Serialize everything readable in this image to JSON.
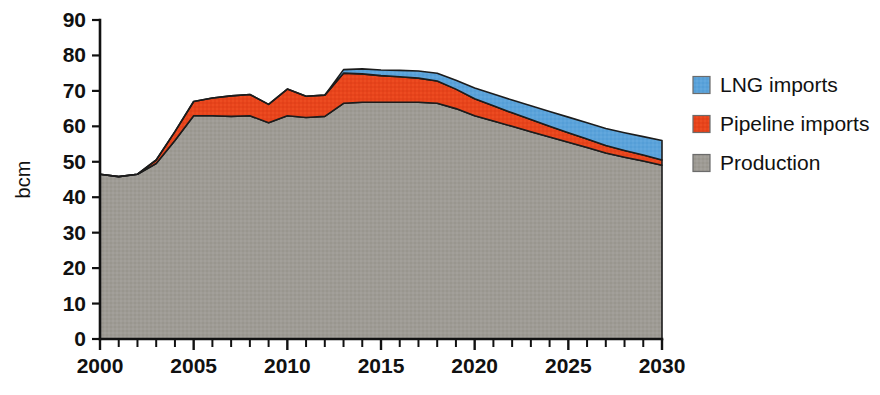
{
  "chart_data": {
    "type": "area",
    "title": "",
    "xlabel": "",
    "ylabel": "bcm",
    "stacked": true,
    "grid": false,
    "legend_position": "right",
    "xlim": [
      2000,
      2030
    ],
    "ylim": [
      0,
      90
    ],
    "y_ticks": [
      0,
      10,
      20,
      30,
      40,
      50,
      60,
      70,
      80,
      90
    ],
    "x_ticks": [
      2000,
      2005,
      2010,
      2015,
      2020,
      2025,
      2030
    ],
    "x_tick_labels": [
      "2000",
      "2005",
      "2010",
      "2015",
      "2020",
      "2025",
      "2030"
    ],
    "y_tick_labels": [
      "0",
      "10",
      "20",
      "30",
      "40",
      "50",
      "60",
      "70",
      "80",
      "90"
    ],
    "x_minor_tick_interval": 1,
    "x": [
      2000,
      2001,
      2002,
      2003,
      2004,
      2005,
      2006,
      2007,
      2008,
      2009,
      2010,
      2011,
      2012,
      2013,
      2014,
      2015,
      2016,
      2017,
      2018,
      2019,
      2020,
      2021,
      2022,
      2023,
      2024,
      2025,
      2026,
      2027,
      2028,
      2029,
      2030
    ],
    "series": [
      {
        "name": "Production",
        "color": "#9e9b95",
        "values": [
          46.5,
          45.8,
          46.5,
          49.5,
          56.0,
          63.0,
          63.0,
          62.8,
          63.0,
          61.0,
          63.0,
          62.5,
          62.8,
          66.5,
          66.8,
          66.8,
          66.8,
          66.8,
          66.5,
          65.0,
          63.0,
          61.5,
          60.0,
          58.5,
          57.0,
          55.5,
          54.0,
          52.5,
          51.3,
          50.2,
          49.0
        ]
      },
      {
        "name": "Pipeline imports",
        "color": "#e8441c",
        "values": [
          0.0,
          0.0,
          0.0,
          1.0,
          2.5,
          4.0,
          5.0,
          5.8,
          6.0,
          5.2,
          7.5,
          6.0,
          6.0,
          8.5,
          8.0,
          7.5,
          7.2,
          6.8,
          6.3,
          5.5,
          4.8,
          4.3,
          3.8,
          3.4,
          3.0,
          2.7,
          2.4,
          2.1,
          1.9,
          1.7,
          1.5
        ]
      },
      {
        "name": "LNG imports",
        "color": "#5ba3da",
        "values": [
          0.0,
          0.0,
          0.0,
          0.0,
          0.0,
          0.0,
          0.0,
          0.0,
          0.0,
          0.0,
          0.0,
          0.0,
          0.0,
          1.0,
          1.4,
          1.6,
          1.8,
          2.0,
          2.2,
          2.5,
          3.0,
          3.3,
          3.6,
          3.9,
          4.2,
          4.4,
          4.6,
          4.8,
          5.0,
          5.2,
          5.5
        ]
      }
    ],
    "legend": [
      {
        "label": "LNG imports",
        "color": "#5ba3da"
      },
      {
        "label": "Pipeline imports",
        "color": "#e8441c"
      },
      {
        "label": "Production",
        "color": "#9e9b95"
      }
    ]
  }
}
